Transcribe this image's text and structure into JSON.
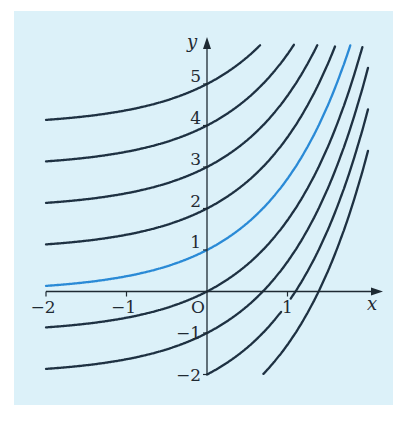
{
  "chart_data": {
    "type": "line",
    "title": "",
    "subtitle": "",
    "xlabel": "x",
    "ylabel": "y",
    "origin_label": "O",
    "xlim": [
      -2,
      2.2
    ],
    "ylim": [
      -2,
      6
    ],
    "grid": false,
    "legend": null,
    "x_ticks": [
      {
        "value": -2,
        "label": "−2"
      },
      {
        "value": -1,
        "label": "−1"
      },
      {
        "value": 1,
        "label": "1"
      }
    ],
    "y_ticks": [
      {
        "value": 5,
        "label": "5"
      },
      {
        "value": 4,
        "label": "4"
      },
      {
        "value": 3,
        "label": "3"
      },
      {
        "value": 2,
        "label": "2"
      },
      {
        "value": 1,
        "label": "1"
      },
      {
        "value": -1,
        "label": "−1"
      },
      {
        "value": -2,
        "label": "−2"
      }
    ],
    "series": [
      {
        "name": "y = e^x + 4",
        "C": 4,
        "highlight": false
      },
      {
        "name": "y = e^x + 3",
        "C": 3,
        "highlight": false
      },
      {
        "name": "y = e^x + 2",
        "C": 2,
        "highlight": false
      },
      {
        "name": "y = e^x + 1",
        "C": 1,
        "highlight": false
      },
      {
        "name": "y = e^x",
        "C": 0,
        "highlight": true
      },
      {
        "name": "y = e^x - 1",
        "C": -1,
        "highlight": false
      },
      {
        "name": "y = e^x - 2",
        "C": -2,
        "highlight": false
      },
      {
        "name": "y = e^x - 3",
        "C": -3,
        "highlight": false,
        "gap_x": [
          0.92,
          1.04
        ]
      },
      {
        "name": "y = e^x - 4",
        "C": -4,
        "highlight": false
      }
    ],
    "x_domain": [
      -2,
      2
    ],
    "sample_points": {
      "C=0": [
        [
          -2,
          0.14
        ],
        [
          -1,
          0.37
        ],
        [
          0,
          1
        ],
        [
          1,
          2.72
        ],
        [
          1.76,
          5.8
        ]
      ],
      "C=4": [
        [
          -2,
          4.14
        ],
        [
          -1,
          4.37
        ],
        [
          0,
          5
        ],
        [
          0.67,
          5.95
        ]
      ],
      "C=-4": [
        [
          0.69,
          -2
        ],
        [
          1.39,
          0
        ],
        [
          2,
          3.39
        ]
      ]
    }
  },
  "colors": {
    "background_panel": "#dcf1f9",
    "page": "#ffffff",
    "curve": "#1e3142",
    "highlight_curve": "#2a8ad6",
    "axis": "#1e2a33"
  }
}
